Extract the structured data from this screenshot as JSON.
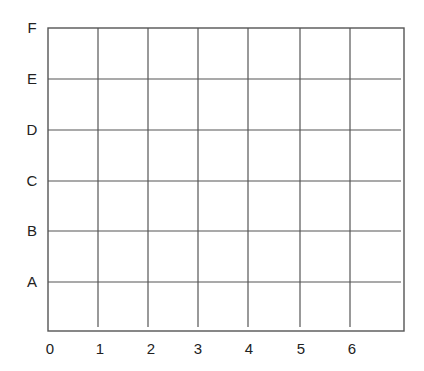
{
  "grid": {
    "x_labels": [
      "0",
      "1",
      "2",
      "3",
      "4",
      "5",
      "6"
    ],
    "y_labels": [
      "A",
      "B",
      "C",
      "D",
      "E",
      "F"
    ],
    "columns": 7,
    "rows": 6,
    "line_color": "#555555",
    "label_color": "#222222"
  }
}
